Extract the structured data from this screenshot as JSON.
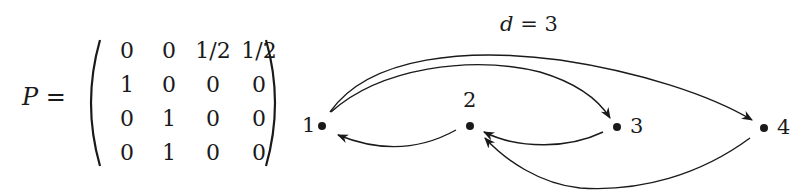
{
  "matrix": {
    "name": "P",
    "equals": "=",
    "rows": [
      [
        "0",
        "0",
        "1/2",
        "1/2"
      ],
      [
        "1",
        "0",
        "0",
        "0"
      ],
      [
        "0",
        "1",
        "0",
        "0"
      ],
      [
        "0",
        "1",
        "0",
        "0"
      ]
    ]
  },
  "graph": {
    "label_var": "d",
    "label_rest": " = 3",
    "nodes": [
      {
        "id": "1",
        "label": "1"
      },
      {
        "id": "2",
        "label": "2"
      },
      {
        "id": "3",
        "label": "3"
      },
      {
        "id": "4",
        "label": "4"
      }
    ],
    "edges": [
      {
        "from": "1",
        "to": "3"
      },
      {
        "from": "1",
        "to": "4"
      },
      {
        "from": "2",
        "to": "1"
      },
      {
        "from": "3",
        "to": "2"
      },
      {
        "from": "4",
        "to": "2"
      }
    ],
    "colors": {
      "ink": "#1a1a1a",
      "background": "#ffffff"
    }
  }
}
